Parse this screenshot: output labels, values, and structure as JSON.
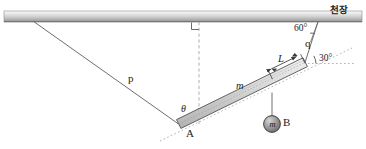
{
  "figure": {
    "width": 366,
    "height": 149
  },
  "ceiling": {
    "label": "천장",
    "label_meaning": "ceiling",
    "color_top": "#f2f2f2",
    "color_mid": "#c9c9c9",
    "color_bottom": "#8f8f8f"
  },
  "labels": {
    "string_p": "p",
    "string_q": "q",
    "angle_theta": "θ",
    "angle_60": "60°",
    "angle_30": "30°",
    "rod_mass": "m",
    "length_L": "L",
    "point_A": "A",
    "ball_mass": "m",
    "ball_B": "B"
  },
  "colors": {
    "line": "#4a4a4a",
    "rod_fill": "#d8d8d8",
    "rod_edge": "#5a5a5a",
    "ball_fill": "#9a9a9a",
    "ball_edge": "#3a3a3a",
    "dash": "#8a8a8a",
    "text": "#1b1b1b"
  },
  "geometry": {
    "ceiling_y": 18,
    "rod_end_A": [
      178,
      124
    ],
    "rod_end_top": [
      305,
      62
    ],
    "string_p_anchor": [
      34,
      20
    ],
    "string_q_anchor": [
      318,
      18
    ],
    "vertical_dash_x": 199,
    "ball_center": [
      272,
      124
    ]
  }
}
